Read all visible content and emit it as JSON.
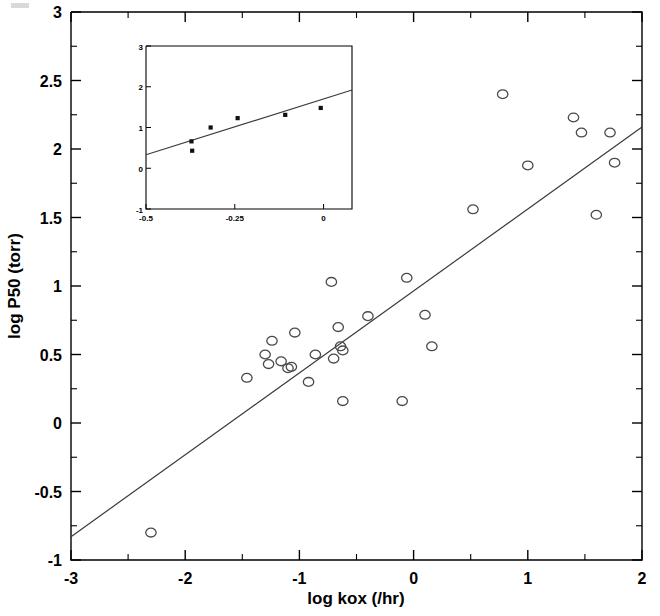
{
  "figure": {
    "background": "#ffffff",
    "marker_open_color": "#4a4a4a",
    "marker_filled_color": "#111111",
    "line_color": "#3a3a3a",
    "axis_color": "#000000"
  },
  "chart_data": {
    "type": "scatter",
    "title": "",
    "xlabel": "log kox (/hr)",
    "ylabel": "log P50 (torr)",
    "xlim": [
      -3,
      2
    ],
    "ylim": [
      -1,
      3
    ],
    "xticks": [
      -3,
      -2,
      -1,
      0,
      1,
      2
    ],
    "xticklabels": [
      "-3",
      "-2",
      "-1",
      "0",
      "1",
      "2"
    ],
    "xminor_step": 0.5,
    "yticks": [
      -1,
      -0.5,
      0,
      0.5,
      1,
      1.5,
      2,
      2.5,
      3
    ],
    "yticklabels": [
      "-1",
      "-0.5",
      "0",
      "0.5",
      "1",
      "1.5",
      "2",
      "2.5",
      "3"
    ],
    "yminor_step": 0.25,
    "grid": false,
    "legend": null,
    "marker": "open-circle",
    "points": [
      {
        "x": -2.3,
        "y": -0.8
      },
      {
        "x": -1.46,
        "y": 0.33
      },
      {
        "x": -1.3,
        "y": 0.5
      },
      {
        "x": -1.27,
        "y": 0.43
      },
      {
        "x": -1.24,
        "y": 0.6
      },
      {
        "x": -1.16,
        "y": 0.45
      },
      {
        "x": -1.1,
        "y": 0.4
      },
      {
        "x": -1.07,
        "y": 0.41
      },
      {
        "x": -1.04,
        "y": 0.66
      },
      {
        "x": -0.92,
        "y": 0.3
      },
      {
        "x": -0.86,
        "y": 0.5
      },
      {
        "x": -0.72,
        "y": 1.03
      },
      {
        "x": -0.7,
        "y": 0.47
      },
      {
        "x": -0.66,
        "y": 0.7
      },
      {
        "x": -0.64,
        "y": 0.56
      },
      {
        "x": -0.62,
        "y": 0.53
      },
      {
        "x": -0.62,
        "y": 0.16
      },
      {
        "x": -0.4,
        "y": 0.78
      },
      {
        "x": -0.1,
        "y": 0.16
      },
      {
        "x": -0.06,
        "y": 1.06
      },
      {
        "x": 0.1,
        "y": 0.79
      },
      {
        "x": 0.16,
        "y": 0.56
      },
      {
        "x": 0.52,
        "y": 1.56
      },
      {
        "x": 0.78,
        "y": 2.4
      },
      {
        "x": 1.0,
        "y": 1.88
      },
      {
        "x": 1.4,
        "y": 2.23
      },
      {
        "x": 1.47,
        "y": 2.12
      },
      {
        "x": 1.6,
        "y": 1.52
      },
      {
        "x": 1.72,
        "y": 2.12
      },
      {
        "x": 1.76,
        "y": 1.9
      }
    ],
    "fit_line": {
      "x_start": -3,
      "y_start": -0.83,
      "x_end": 2,
      "y_end": 2.16,
      "slope": 0.598,
      "intercept": 0.963
    },
    "inset": {
      "type": "scatter",
      "xlabel": "",
      "ylabel": "",
      "xlim": [
        -0.5,
        0.08
      ],
      "ylim": [
        -1,
        3
      ],
      "xticks": [
        -0.5,
        -0.25,
        0
      ],
      "xticklabels": [
        "-0.5",
        "-0.25",
        "0"
      ],
      "yticks": [
        -1,
        0,
        1,
        2,
        3
      ],
      "yticklabels": [
        "-1",
        "0",
        "1",
        "2",
        "3"
      ],
      "grid": false,
      "marker": "filled-square",
      "points": [
        {
          "x": -0.372,
          "y": 0.66
        },
        {
          "x": -0.37,
          "y": 0.43
        },
        {
          "x": -0.318,
          "y": 1.0
        },
        {
          "x": -0.242,
          "y": 1.23
        },
        {
          "x": -0.108,
          "y": 1.31
        },
        {
          "x": -0.008,
          "y": 1.48
        }
      ],
      "fit_line": {
        "x_start": -0.5,
        "y_start": 0.33,
        "x_end": 0.08,
        "y_end": 1.92
      }
    }
  }
}
